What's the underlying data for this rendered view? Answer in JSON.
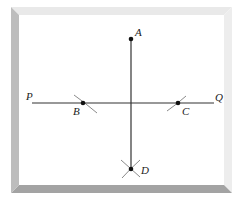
{
  "figure": {
    "frame": {
      "outer": {
        "x": 11,
        "y": 7,
        "w": 221,
        "h": 186
      },
      "bevel": 8,
      "colors": {
        "top": "#e9e9e9",
        "right": "#ededed",
        "bottom": "#a3a3a3",
        "left": "#bdbdbd",
        "inner": "#ffffff"
      }
    },
    "stroke_color": "#333333",
    "arc_color": "#8a8a8a",
    "lines": [
      {
        "id": "PQ",
        "x1": 32,
        "y1": 103,
        "x2": 214,
        "y2": 103
      },
      {
        "id": "AD",
        "x1": 131,
        "y1": 39,
        "x2": 131,
        "y2": 169
      }
    ],
    "points": [
      {
        "id": "A",
        "label": "A",
        "x": 131,
        "y": 39,
        "label_x": 135,
        "label_y": 36
      },
      {
        "id": "B",
        "label": "B",
        "x": 83,
        "y": 103,
        "label_x": 73,
        "label_y": 115
      },
      {
        "id": "C",
        "label": "C",
        "x": 178,
        "y": 103,
        "label_x": 182,
        "label_y": 115
      },
      {
        "id": "D",
        "label": "D",
        "x": 131,
        "y": 169,
        "label_x": 141,
        "label_y": 174
      }
    ],
    "endpoint_labels": [
      {
        "id": "P",
        "label": "P",
        "x": 26,
        "y": 100
      },
      {
        "id": "Q",
        "label": "Q",
        "x": 215,
        "y": 101
      }
    ],
    "arcs": [
      {
        "id": "arc-B",
        "d": "M74,95 Q84,102 97,113"
      },
      {
        "id": "arc-C",
        "d": "M167,111 Q177,104 186,96"
      },
      {
        "id": "arc-D1",
        "d": "M121,160 Q130,168 140,177"
      },
      {
        "id": "arc-D2",
        "d": "M140,160 Q131,168 122,178"
      }
    ]
  }
}
